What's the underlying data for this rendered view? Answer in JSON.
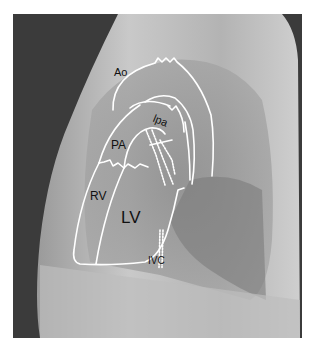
{
  "image": {
    "type": "lateral chest radiograph",
    "description": "Lateral chest X-ray with white outlines of cardiac chambers and great vessels"
  },
  "labels": {
    "ao": "Ao",
    "lpa": "lpa",
    "pa": "PA",
    "rv": "RV",
    "lv": "LV",
    "ivc": "IVC"
  },
  "colors": {
    "outline": "#ffffff",
    "label_text": "#111111",
    "background_dark": "#3a3a3a",
    "body_light": "#b8b8b8"
  }
}
